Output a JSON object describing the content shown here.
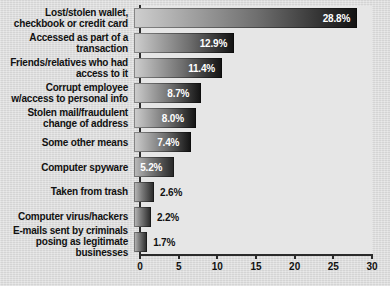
{
  "chart_data": {
    "type": "bar",
    "orientation": "horizontal",
    "title": "",
    "xlabel": "",
    "ylabel": "",
    "xlim": [
      0,
      30
    ],
    "xticks": [
      "0",
      "5",
      "10",
      "15",
      "20",
      "25",
      "30"
    ],
    "grid": false,
    "legend": false,
    "categories": [
      "Lost/stolen wallet,\ncheckbook or credit card",
      "Accessed as part of a\ntransaction",
      "Friends/relatives who had\naccess to it",
      "Corrupt employee\nw/access to personal info",
      "Stolen mail/fraudulent\nchange of address",
      "Some other means",
      "Computer spyware",
      "Taken from trash",
      "Computer virus/hackers",
      "E-mails sent by criminals\nposing as legitimate\nbusinesses"
    ],
    "values": [
      28.8,
      12.9,
      11.4,
      8.7,
      8.0,
      7.4,
      5.2,
      2.6,
      2.2,
      1.7
    ],
    "value_labels": [
      "28.8%",
      "12.9%",
      "11.4%",
      "8.7%",
      "8.0%",
      "7.4%",
      "5.2%",
      "2.6%",
      "2.2%",
      "1.7%"
    ]
  },
  "style": {
    "background": "#dcdcdc",
    "plot_background": "#e6e6e6",
    "axis_color": "#2b2b2b",
    "bar_light": "#cfcfcf",
    "bar_dark": "#121212",
    "label_color": "#111111",
    "value_inside_color": "#ffffff"
  }
}
